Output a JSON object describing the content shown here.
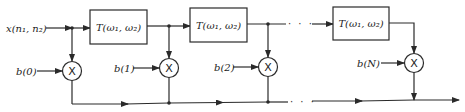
{
  "diagram": {
    "type": "FIR-style filter structure (2-D)",
    "input_label": "x(n₁, n₂)",
    "blocks": [
      {
        "label": "T(ω₁, ω₂)"
      },
      {
        "label": "T(ω₁, ω₂)"
      },
      {
        "label": "T(ω₁, ω₂)"
      }
    ],
    "coefficients": [
      {
        "label": "b(0)"
      },
      {
        "label": "b(1)"
      },
      {
        "label": "b(2)"
      },
      {
        "label": "b(N)"
      }
    ],
    "multiplier_symbol": "X",
    "ellipsis": "· · ·"
  }
}
